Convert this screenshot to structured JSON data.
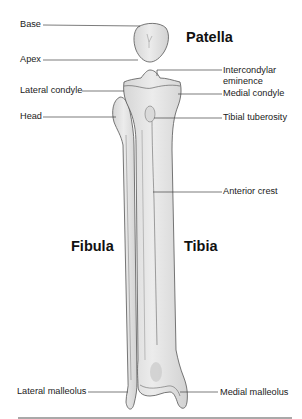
{
  "diagram": {
    "titles": {
      "patella": "Patella",
      "fibula": "Fibula",
      "tibia": "Tibia"
    },
    "labels_left": [
      {
        "id": "base",
        "text": "Base"
      },
      {
        "id": "apex",
        "text": "Apex"
      },
      {
        "id": "lateral-condyle",
        "text": "Lateral condyle"
      },
      {
        "id": "head",
        "text": "Head"
      },
      {
        "id": "lateral-malleolus",
        "text": "Lateral malleolus"
      }
    ],
    "labels_right": [
      {
        "id": "intercondylar-eminence",
        "text": "Intercondylar",
        "text2": "eminence"
      },
      {
        "id": "medial-condyle",
        "text": "Medial condyle"
      },
      {
        "id": "tibial-tuberosity",
        "text": "Tibial tuberosity"
      },
      {
        "id": "anterior-crest",
        "text": "Anterior crest"
      },
      {
        "id": "medial-malleolus",
        "text": "Medial malleolus"
      }
    ],
    "colors": {
      "bone_fill": "#e4e4e4",
      "bone_shade": "#cfcfcf",
      "outline": "#555555",
      "leader": "#444444",
      "text": "#222222"
    }
  }
}
